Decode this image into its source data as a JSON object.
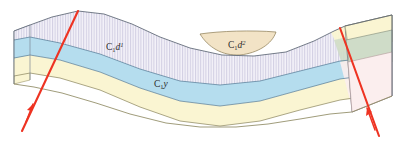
{
  "figure": {
    "type": "geological-cross-section-block-diagram",
    "background_color": "#ffffff",
    "width": 405,
    "height": 141
  },
  "labels": {
    "upper_unit_left": {
      "prefix": "C",
      "subscript": "1",
      "root": "d",
      "superscript": "1",
      "full_text": "C1d1",
      "x": 112,
      "y": 48
    },
    "upper_unit_lens": {
      "prefix": "C",
      "subscript": "1",
      "root": "d",
      "superscript": "2",
      "full_text": "C1d2",
      "x": 235,
      "y": 46
    },
    "lower_unit": {
      "prefix": "C",
      "subscript": "1",
      "root": "y",
      "superscript": "",
      "full_text": "C1y",
      "x": 160,
      "y": 85
    }
  },
  "strata": [
    {
      "name": "upper-hatched-unit",
      "label": "C1d1",
      "fill": "#f2f0f7",
      "hatch": "vertical-lines",
      "hatch_color": "#c9c6dd",
      "stroke": "#6b7a90"
    },
    {
      "name": "tan-lens-unit",
      "label": "C1d2",
      "fill": "#f2e3c6",
      "hatch": "none",
      "stroke": "#8a7a52"
    },
    {
      "name": "blue-unit",
      "label": "C1y",
      "fill": "#b5ddee",
      "hatch": "none",
      "stroke": "#5f8ba6"
    },
    {
      "name": "cream-unit",
      "label": "",
      "fill": "#faf5d2",
      "hatch": "none",
      "stroke": "#9a9367"
    },
    {
      "name": "green-face-unit",
      "label": "",
      "fill": "#cfdcc8",
      "hatch": "none",
      "stroke": "#7f8a78"
    },
    {
      "name": "pink-face-unit",
      "label": "",
      "fill": "#fbeeee",
      "hatch": "none",
      "stroke": "#b29a9a"
    }
  ],
  "faults": [
    {
      "name": "left-fault",
      "color": "#ee3322",
      "arrow": "up-slip",
      "top_x": 78,
      "top_y": 11,
      "bottom_x": 22,
      "bottom_y": 131
    },
    {
      "name": "right-fault",
      "color": "#ee3322",
      "arrow": "up-slip",
      "top_x": 340,
      "top_y": 28,
      "bottom_x": 379,
      "bottom_y": 136
    }
  ],
  "colors": {
    "fault_red": "#ee3322",
    "hatch_lavender": "#f2f0f7",
    "blue_layer": "#b5ddee",
    "cream_layer": "#faf5d2",
    "tan_lens": "#f2e3c6",
    "green_layer": "#cfdcc8",
    "pink_layer": "#fbeeee",
    "outline_gray": "#6f6f6f"
  }
}
